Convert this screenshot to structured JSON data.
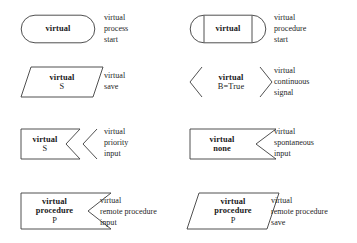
{
  "legend": {
    "title": "virtual flowchart symbols",
    "items": [
      {
        "id": "virtual-process-start",
        "shape": "stadium",
        "label_line1": "virtual",
        "label_line2": "",
        "label_line3": "",
        "caption_lines": [
          "virtual",
          "process",
          "start"
        ]
      },
      {
        "id": "virtual-procedure-start",
        "shape": "stadium-subroutine",
        "label_line1": "virtual",
        "label_line2": "",
        "label_line3": "",
        "caption_lines": [
          "virtual",
          "procedure",
          "start"
        ]
      },
      {
        "id": "virtual-save",
        "shape": "parallelogram",
        "label_line1": "virtual",
        "label_line2": "S",
        "label_line3": "",
        "caption_lines": [
          "virtual",
          "save"
        ]
      },
      {
        "id": "virtual-continuous-signal",
        "shape": "open-chevrons",
        "label_line1": "virtual",
        "label_line2": "B=True",
        "label_line3": "",
        "caption_lines": [
          "virtual",
          "continuous",
          "signal"
        ]
      },
      {
        "id": "virtual-priority-input",
        "shape": "flag-double-notch",
        "label_line1": "virtual",
        "label_line2": "S",
        "label_line3": "",
        "caption_lines": [
          "virtual",
          "priority",
          "input"
        ]
      },
      {
        "id": "virtual-spontaneous-input",
        "shape": "flag-notch",
        "label_line1": "virtual",
        "label_line2": "none",
        "label_line3": "",
        "caption_lines": [
          "virtual",
          "spontaneous",
          "input"
        ]
      },
      {
        "id": "virtual-remote-procedure-input",
        "shape": "flag-notch",
        "label_line1": "virtual",
        "label_line2": "procedure",
        "label_line3": "P",
        "caption_lines": [
          "virtual",
          "remote procedure",
          "input"
        ]
      },
      {
        "id": "virtual-remote-procedure-save",
        "shape": "parallelogram",
        "label_line1": "virtual",
        "label_line2": "procedure",
        "label_line3": "P",
        "caption_lines": [
          "virtual",
          "remote procedure",
          "save"
        ]
      }
    ],
    "colors": {
      "stroke": "#3c3c3c",
      "text": "#1a1a1a",
      "caption_text": "#262626",
      "background": "#ffffff"
    }
  }
}
